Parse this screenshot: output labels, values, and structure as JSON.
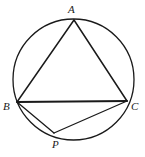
{
  "figure": {
    "background_color": "#ffffff",
    "stroke_color": "#1a1a1a",
    "label_color": "#1a1a1a",
    "canvas": {
      "width": 145,
      "height": 157
    },
    "circle": {
      "name": "circumcircle",
      "cx": 73.5,
      "cy": 79.5,
      "r": 60.5,
      "stroke_width": 1.3
    },
    "points": [
      {
        "id": "A",
        "label": "A",
        "x": 74,
        "y": 20,
        "label_x": 68,
        "label_y": 4
      },
      {
        "id": "B",
        "label": "B",
        "x": 17,
        "y": 102,
        "label_x": 3,
        "label_y": 101
      },
      {
        "id": "C",
        "label": "C",
        "x": 127,
        "y": 101,
        "label_x": 131,
        "label_y": 101
      },
      {
        "id": "P",
        "label": "P",
        "x": 54,
        "y": 133,
        "label_x": 52,
        "label_y": 139
      }
    ],
    "segments": [
      {
        "id": "AB",
        "from": "A",
        "to": "B",
        "x1": 74,
        "y1": 20,
        "x2": 17,
        "y2": 102,
        "stroke_width": 1.5
      },
      {
        "id": "AC",
        "from": "A",
        "to": "C",
        "x1": 74,
        "y1": 20,
        "x2": 127,
        "y2": 101,
        "stroke_width": 1.5
      },
      {
        "id": "BC",
        "from": "B",
        "to": "C",
        "x1": 17,
        "y1": 102,
        "x2": 127,
        "y2": 101,
        "stroke_width": 1.8
      },
      {
        "id": "BP",
        "from": "B",
        "to": "P",
        "x1": 17,
        "y1": 102,
        "x2": 54,
        "y2": 133,
        "stroke_width": 1.3
      },
      {
        "id": "PC",
        "from": "P",
        "to": "C",
        "x1": 54,
        "y1": 133,
        "x2": 127,
        "y2": 101,
        "stroke_width": 1.3
      }
    ]
  }
}
